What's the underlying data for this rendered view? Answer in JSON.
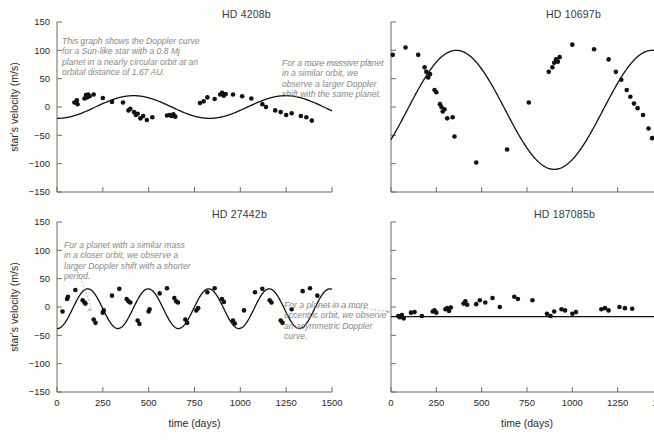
{
  "figure": {
    "xlabel": "time (days)",
    "ylabel": "star's velocity (m/s)",
    "xticks": [
      0,
      250,
      500,
      750,
      1000,
      1250,
      1500
    ],
    "yticks": [
      150,
      100,
      50,
      0,
      -50,
      -100,
      -150
    ],
    "xlim": [
      0,
      1500
    ],
    "ylim": [
      -150,
      150
    ],
    "curve_color": "#111111",
    "point_color": "#111111",
    "annotation_color": "#8f8f8f",
    "axis_color": "#6b6b6b"
  },
  "chart_data": [
    {
      "type": "scatter",
      "title": "HD 4208b",
      "xlabel": "time (days)",
      "ylabel": "star's velocity (m/s)",
      "xlim": [
        0,
        1500
      ],
      "ylim": [
        -150,
        150
      ],
      "grid": false,
      "legend": "none",
      "annotation": "This graph shows the Doppler curve for a Sun-like star with a 0.8 Mj planet in a nearly circular orbit at an orbital distance of 1.67 AU.",
      "model": {
        "shape": "sinusoid",
        "amplitude": 20,
        "period": 830,
        "phase_days": 210,
        "offset": 0,
        "eccentricity": 0.05
      },
      "points": [
        {
          "x": 95,
          "y": 8
        },
        {
          "x": 108,
          "y": 12
        },
        {
          "x": 112,
          "y": 5
        },
        {
          "x": 150,
          "y": 15
        },
        {
          "x": 158,
          "y": 21
        },
        {
          "x": 165,
          "y": 17
        },
        {
          "x": 170,
          "y": 22
        },
        {
          "x": 178,
          "y": 19
        },
        {
          "x": 200,
          "y": 22
        },
        {
          "x": 250,
          "y": 16
        },
        {
          "x": 300,
          "y": 9
        },
        {
          "x": 360,
          "y": 8
        },
        {
          "x": 390,
          "y": -6
        },
        {
          "x": 400,
          "y": -3
        },
        {
          "x": 420,
          "y": -9
        },
        {
          "x": 430,
          "y": -14
        },
        {
          "x": 440,
          "y": -12
        },
        {
          "x": 455,
          "y": -20
        },
        {
          "x": 470,
          "y": -16
        },
        {
          "x": 490,
          "y": -23
        },
        {
          "x": 520,
          "y": -18
        },
        {
          "x": 600,
          "y": -15
        },
        {
          "x": 615,
          "y": -14
        },
        {
          "x": 625,
          "y": -16
        },
        {
          "x": 635,
          "y": -13
        },
        {
          "x": 645,
          "y": -17
        },
        {
          "x": 780,
          "y": 7
        },
        {
          "x": 800,
          "y": 10
        },
        {
          "x": 820,
          "y": 17
        },
        {
          "x": 860,
          "y": 14
        },
        {
          "x": 890,
          "y": 22
        },
        {
          "x": 900,
          "y": 25
        },
        {
          "x": 910,
          "y": 20
        },
        {
          "x": 920,
          "y": 23
        },
        {
          "x": 960,
          "y": 22
        },
        {
          "x": 1010,
          "y": 19
        },
        {
          "x": 1060,
          "y": 15
        },
        {
          "x": 1120,
          "y": 5
        },
        {
          "x": 1140,
          "y": 0
        },
        {
          "x": 1190,
          "y": -6
        },
        {
          "x": 1220,
          "y": -9
        },
        {
          "x": 1250,
          "y": -14
        },
        {
          "x": 1280,
          "y": -11
        },
        {
          "x": 1330,
          "y": -16
        },
        {
          "x": 1360,
          "y": -18
        },
        {
          "x": 1390,
          "y": -24
        }
      ]
    },
    {
      "type": "scatter",
      "title": "HD 10697b",
      "xlabel": "time (days)",
      "ylabel": "star's velocity (m/s)",
      "xlim": [
        0,
        1500
      ],
      "ylim": [
        -150,
        150
      ],
      "grid": false,
      "legend": "none",
      "annotation": "For a more massive planet in a similar orbit, we observe a larger Doppler shift with the same planet.",
      "model": {
        "shape": "sinusoid",
        "amplitude": 105,
        "period": 1080,
        "phase_days": 90,
        "offset": -5,
        "eccentricity": 0.1
      },
      "points": [
        {
          "x": 10,
          "y": 92
        },
        {
          "x": 80,
          "y": 105
        },
        {
          "x": 150,
          "y": 92
        },
        {
          "x": 185,
          "y": 70
        },
        {
          "x": 195,
          "y": 62
        },
        {
          "x": 205,
          "y": 52
        },
        {
          "x": 215,
          "y": 58
        },
        {
          "x": 240,
          "y": 30
        },
        {
          "x": 250,
          "y": 26
        },
        {
          "x": 270,
          "y": 5
        },
        {
          "x": 278,
          "y": 0
        },
        {
          "x": 285,
          "y": -8
        },
        {
          "x": 295,
          "y": -4
        },
        {
          "x": 310,
          "y": -20
        },
        {
          "x": 340,
          "y": -18
        },
        {
          "x": 350,
          "y": -52
        },
        {
          "x": 470,
          "y": -98
        },
        {
          "x": 640,
          "y": -75
        },
        {
          "x": 760,
          "y": 8
        },
        {
          "x": 870,
          "y": 62
        },
        {
          "x": 890,
          "y": 70
        },
        {
          "x": 900,
          "y": 78
        },
        {
          "x": 910,
          "y": 84
        },
        {
          "x": 920,
          "y": 80
        },
        {
          "x": 930,
          "y": 88
        },
        {
          "x": 1000,
          "y": 110
        },
        {
          "x": 1120,
          "y": 102
        },
        {
          "x": 1200,
          "y": 84
        },
        {
          "x": 1240,
          "y": 62
        },
        {
          "x": 1270,
          "y": 48
        },
        {
          "x": 1300,
          "y": 30
        },
        {
          "x": 1320,
          "y": 18
        },
        {
          "x": 1340,
          "y": 6
        },
        {
          "x": 1360,
          "y": -2
        },
        {
          "x": 1390,
          "y": -14
        },
        {
          "x": 1420,
          "y": -38
        },
        {
          "x": 1440,
          "y": -55
        }
      ]
    },
    {
      "type": "scatter",
      "title": "HD 27442b",
      "xlabel": "time (days)",
      "ylabel": "star's velocity (m/s)",
      "xlim": [
        0,
        1500
      ],
      "ylim": [
        -150,
        150
      ],
      "grid": false,
      "legend": "none",
      "annotation": "For a planet with a similar mass in a closer orbit, we observe a larger Doppler shift with a shorter period.",
      "model": {
        "shape": "sinusoid",
        "amplitude": 35,
        "period": 330,
        "phase_days": 85,
        "offset": -3,
        "eccentricity": 0.07
      },
      "points": [
        {
          "x": 30,
          "y": -8
        },
        {
          "x": 55,
          "y": 14
        },
        {
          "x": 60,
          "y": 18
        },
        {
          "x": 100,
          "y": 30
        },
        {
          "x": 140,
          "y": 12
        },
        {
          "x": 150,
          "y": 8
        },
        {
          "x": 155,
          "y": 6
        },
        {
          "x": 200,
          "y": -22
        },
        {
          "x": 210,
          "y": -28
        },
        {
          "x": 250,
          "y": -10
        },
        {
          "x": 255,
          "y": -6
        },
        {
          "x": 300,
          "y": 20
        },
        {
          "x": 340,
          "y": 32
        },
        {
          "x": 380,
          "y": 14
        },
        {
          "x": 390,
          "y": 10
        },
        {
          "x": 400,
          "y": 8
        },
        {
          "x": 440,
          "y": -24
        },
        {
          "x": 450,
          "y": -30
        },
        {
          "x": 500,
          "y": -8
        },
        {
          "x": 505,
          "y": -4
        },
        {
          "x": 560,
          "y": 24
        },
        {
          "x": 600,
          "y": 33
        },
        {
          "x": 640,
          "y": 16
        },
        {
          "x": 650,
          "y": 10
        },
        {
          "x": 660,
          "y": 8
        },
        {
          "x": 700,
          "y": -22
        },
        {
          "x": 710,
          "y": -28
        },
        {
          "x": 760,
          "y": -6
        },
        {
          "x": 770,
          "y": -2
        },
        {
          "x": 820,
          "y": 26
        },
        {
          "x": 860,
          "y": 33
        },
        {
          "x": 900,
          "y": 14
        },
        {
          "x": 910,
          "y": 9
        },
        {
          "x": 960,
          "y": -24
        },
        {
          "x": 970,
          "y": -29
        },
        {
          "x": 1020,
          "y": -6
        },
        {
          "x": 1080,
          "y": 26
        },
        {
          "x": 1120,
          "y": 32
        },
        {
          "x": 1160,
          "y": 12
        },
        {
          "x": 1170,
          "y": 8
        },
        {
          "x": 1220,
          "y": -24
        },
        {
          "x": 1230,
          "y": -28
        },
        {
          "x": 1280,
          "y": -4
        },
        {
          "x": 1340,
          "y": 28
        },
        {
          "x": 1380,
          "y": 33
        },
        {
          "x": 1420,
          "y": 20
        }
      ]
    },
    {
      "type": "scatter",
      "title": "HD 187085b",
      "xlabel": "time (days)",
      "ylabel": "star's velocity (m/s)",
      "xlim": [
        0,
        1500
      ],
      "ylim": [
        -150,
        150
      ],
      "grid": false,
      "legend": "none",
      "annotation": "For a planet in a more eccentric orbit, we observe an asymmetric Doppler curve.",
      "model": {
        "shape": "eccentric",
        "amplitude": 30,
        "period": 1020,
        "eccentricity": 0.75,
        "offset": 0
      },
      "points": [
        {
          "x": 40,
          "y": -16
        },
        {
          "x": 48,
          "y": -18
        },
        {
          "x": 60,
          "y": -14
        },
        {
          "x": 70,
          "y": -20
        },
        {
          "x": 110,
          "y": -10
        },
        {
          "x": 130,
          "y": -9
        },
        {
          "x": 170,
          "y": -16
        },
        {
          "x": 230,
          "y": -8
        },
        {
          "x": 240,
          "y": -6
        },
        {
          "x": 250,
          "y": -10
        },
        {
          "x": 300,
          "y": -4
        },
        {
          "x": 310,
          "y": -2
        },
        {
          "x": 320,
          "y": -7
        },
        {
          "x": 330,
          "y": -1
        },
        {
          "x": 400,
          "y": 6
        },
        {
          "x": 410,
          "y": 10
        },
        {
          "x": 420,
          "y": 4
        },
        {
          "x": 470,
          "y": 5
        },
        {
          "x": 490,
          "y": 12
        },
        {
          "x": 520,
          "y": 8
        },
        {
          "x": 560,
          "y": 16
        },
        {
          "x": 600,
          "y": 0
        },
        {
          "x": 680,
          "y": 18
        },
        {
          "x": 700,
          "y": 14
        },
        {
          "x": 780,
          "y": 12
        },
        {
          "x": 860,
          "y": -12
        },
        {
          "x": 880,
          "y": -16
        },
        {
          "x": 900,
          "y": -8
        },
        {
          "x": 940,
          "y": -4
        },
        {
          "x": 960,
          "y": -6
        },
        {
          "x": 1000,
          "y": -12
        },
        {
          "x": 1020,
          "y": -9
        },
        {
          "x": 1160,
          "y": -4
        },
        {
          "x": 1180,
          "y": -2
        },
        {
          "x": 1200,
          "y": -6
        },
        {
          "x": 1260,
          "y": 0
        },
        {
          "x": 1290,
          "y": -2
        },
        {
          "x": 1330,
          "y": -3
        }
      ]
    }
  ]
}
